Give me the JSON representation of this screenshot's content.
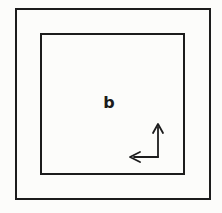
{
  "figure": {
    "region_label": "b",
    "shapes": {
      "outer_square": "outer-boundary",
      "inner_square": "inner-boundary"
    },
    "icons": {
      "axes": "axes-arrows (up arrow and left arrow joined at lower-right corner)"
    }
  },
  "colors": {
    "line": "#1c1c1c",
    "background": "#fcfcfa"
  }
}
